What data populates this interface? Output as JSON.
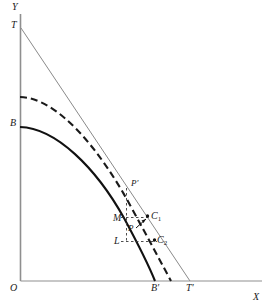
{
  "figure": {
    "type": "line-diagram",
    "background_color": "#ffffff",
    "ink_color": "#1a1a1a",
    "tangent_color": "#7a7a7a",
    "axis_color": "#8c8c8c",
    "width": 269,
    "height": 307
  },
  "axes": {
    "y_axis_label": "Y",
    "x_axis_label": "X",
    "origin_label": "O",
    "y_axis_x": 20,
    "y_axis_top": 14,
    "x_axis_y": 281,
    "x_axis_right": 262
  },
  "labels": [
    {
      "id": "y-axis",
      "text": "Y",
      "x": 12,
      "y": 2,
      "italic": true
    },
    {
      "id": "t",
      "text": "T",
      "x": 11,
      "y": 20,
      "italic": true
    },
    {
      "id": "b",
      "text": "B",
      "x": 10,
      "y": 118,
      "italic": true
    },
    {
      "id": "o",
      "text": "O",
      "x": 10,
      "y": 283,
      "italic": true
    },
    {
      "id": "b-prime",
      "text": "B′",
      "x": 151,
      "y": 283,
      "italic": true
    },
    {
      "id": "t-prime",
      "text": "T′",
      "x": 186,
      "y": 283,
      "italic": true
    },
    {
      "id": "x-axis",
      "text": "X",
      "x": 253,
      "y": 292,
      "italic": true
    },
    {
      "id": "p-prime",
      "text": "P′",
      "x": 131,
      "y": 179,
      "italic": true
    },
    {
      "id": "m",
      "text": "M",
      "x": 113,
      "y": 213,
      "italic": true
    },
    {
      "id": "c1",
      "text": "C",
      "sub": "1",
      "x": 151,
      "y": 212,
      "italic": true
    },
    {
      "id": "p",
      "text": "P",
      "x": 128,
      "y": 225,
      "italic": true
    },
    {
      "id": "l",
      "text": "L",
      "x": 114,
      "y": 237,
      "italic": true
    },
    {
      "id": "c2",
      "text": "C",
      "sub": "2",
      "x": 157,
      "y": 236,
      "italic": true
    }
  ],
  "curves": {
    "solid_frontier": {
      "name": "solid-production-frontier",
      "from_label": "B",
      "to_label": "B′",
      "path": "M 20 127 C 56 128 96 168 124 218 C 138 244 149 266 155 281"
    },
    "dashed_frontier": {
      "name": "dashed-production-frontier",
      "from_y": 97,
      "to_label": "B′ right of",
      "path": "M 20 97 C 58 98 100 150 130 205 C 148 238 163 266 171 281"
    },
    "tangent_line": {
      "name": "tangent-line-T-Tprime",
      "x1": 21,
      "y1": 28,
      "x2": 190,
      "y2": 281
    }
  },
  "construction": {
    "vertical_dashed": {
      "x": 126,
      "y_top": 187,
      "y_bottom": 243
    },
    "horizontal_dashed_M": {
      "y": 217,
      "x_left": 121,
      "x_right": 150
    },
    "horizontal_dashed_L": {
      "y": 241,
      "x_left": 121,
      "x_right": 156
    },
    "point_P_prime": {
      "x": 128,
      "y": 188
    },
    "point_C1": {
      "x": 148,
      "y": 216
    },
    "point_C2": {
      "x": 155,
      "y": 240
    },
    "point_P": {
      "x": 137,
      "y": 228
    }
  }
}
